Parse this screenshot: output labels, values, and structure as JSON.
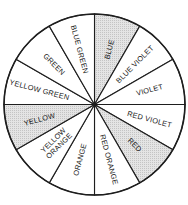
{
  "diagram": {
    "center": [
      94.5,
      104.5
    ],
    "radius": 90.5,
    "shade_color": "#d9d9d9",
    "plain_color": "#ffffff",
    "line_color": "#1e1e1e",
    "segments": [
      {
        "label": "BLUE",
        "lines": [
          "BLUE"
        ],
        "shaded": true
      },
      {
        "label": "BLUE VIOLET",
        "lines": [
          "BLUE VIOLET"
        ],
        "shaded": false
      },
      {
        "label": "VIOLET",
        "lines": [
          "VIOLET"
        ],
        "shaded": false
      },
      {
        "label": "RED VIOLET",
        "lines": [
          "RED VIOLET"
        ],
        "shaded": false
      },
      {
        "label": "RED",
        "lines": [
          "RED"
        ],
        "shaded": true
      },
      {
        "label": "RED ORANGE",
        "lines": [
          "RED ORANGE"
        ],
        "shaded": false
      },
      {
        "label": "ORANGE",
        "lines": [
          "ORANGE"
        ],
        "shaded": false
      },
      {
        "label": "YELLOW ORANGE",
        "lines": [
          "YELLOW",
          "ORANGE"
        ],
        "shaded": false
      },
      {
        "label": "YELLOW",
        "lines": [
          "YELLOW"
        ],
        "shaded": true
      },
      {
        "label": "YELLOW GREEN",
        "lines": [
          "YELLOW GREEN"
        ],
        "shaded": false
      },
      {
        "label": "GREEN",
        "lines": [
          "GREEN"
        ],
        "shaded": false
      },
      {
        "label": "BLUE GREEN",
        "lines": [
          "BLUE GREEN"
        ],
        "shaded": false
      }
    ]
  }
}
